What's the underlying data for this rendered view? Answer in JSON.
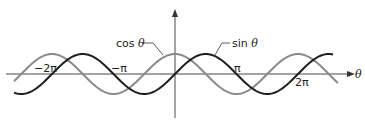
{
  "chart_data": {
    "type": "line",
    "title": "",
    "xlabel": "θ",
    "ylabel": "",
    "x_ticks": [
      "−2π",
      "−π",
      "π",
      "2π"
    ],
    "xlim": [
      "-2.3π",
      "2.7π"
    ],
    "ylim": [
      -1,
      1
    ],
    "grid": false,
    "series": [
      {
        "name": "cos θ",
        "function": "cos",
        "color": "#8a8a8a"
      },
      {
        "name": "sin θ",
        "function": "sin",
        "color": "#1e1e1e"
      }
    ],
    "annotations": [
      {
        "text": "cos θ",
        "points_to": "cos curve near θ≈−0.5"
      },
      {
        "text": "sin θ",
        "points_to": "sin curve near θ≈1.2"
      }
    ]
  },
  "labels": {
    "cos": "cos",
    "sin": "sin",
    "theta": "θ",
    "neg2pi": "−2π",
    "negpi": "−π",
    "pi": "π",
    "twopi": "2π"
  }
}
